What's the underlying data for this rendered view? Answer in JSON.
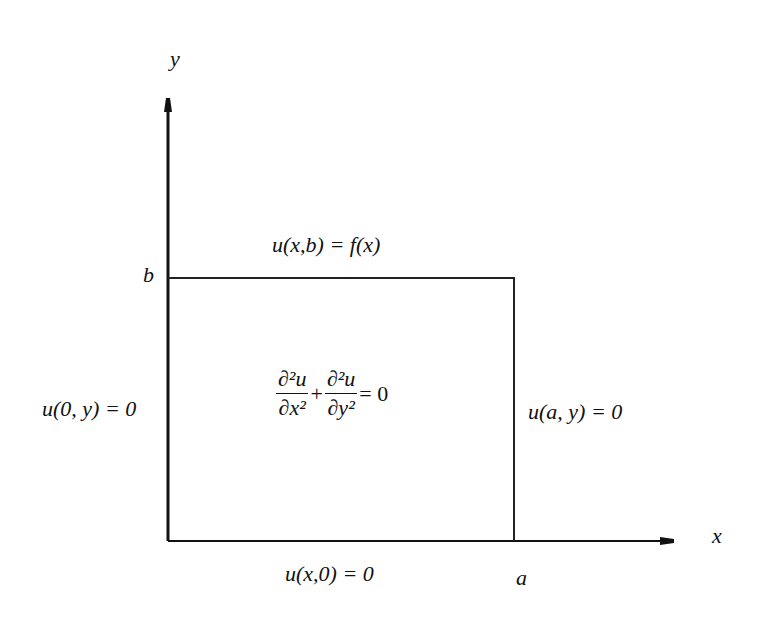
{
  "diagram": {
    "type": "boundary-value-problem",
    "axes": {
      "x_label": "x",
      "y_label": "y"
    },
    "corner_labels": {
      "top_left": "b",
      "bottom_right": "a"
    },
    "boundary_conditions": {
      "top": "u(x,b) = f(x)",
      "left": "u(0, y) = 0",
      "right": "u(a, y) = 0",
      "bottom": "u(x,0) = 0"
    },
    "pde": {
      "term1_num": "∂²u",
      "term1_den": "∂x²",
      "operator": "+",
      "term2_num": "∂²u",
      "term2_den": "∂y²",
      "rhs": "= 0"
    },
    "colors": {
      "line": "#111111",
      "background": "#ffffff"
    }
  }
}
